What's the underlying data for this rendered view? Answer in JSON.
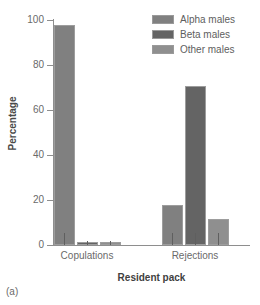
{
  "caption": "(a)",
  "legend": {
    "position": "top-right",
    "entries": [
      {
        "label": "Alpha males",
        "color": "#808080"
      },
      {
        "label": "Beta males",
        "color": "#646464"
      },
      {
        "label": "Other males",
        "color": "#8f8f8f"
      }
    ]
  },
  "axes": {
    "ylabel": "Percentage",
    "xlabel": "Resident pack",
    "yticks": [
      {
        "value": 100,
        "label": "100"
      },
      {
        "value": 80,
        "label": "80"
      },
      {
        "value": 60,
        "label": "60"
      },
      {
        "value": 40,
        "label": "40"
      },
      {
        "value": 20,
        "label": "20"
      },
      {
        "value": 0,
        "label": "0"
      }
    ],
    "xticks": [
      "Copulations",
      "Rejections"
    ]
  },
  "chart_data": {
    "type": "bar",
    "title": "",
    "xlabel": "Resident pack",
    "ylabel": "Percentage",
    "ylim": [
      0,
      100
    ],
    "grid": false,
    "legend_position": "top-right",
    "categories": [
      "Copulations",
      "Rejections"
    ],
    "series": [
      {
        "name": "Alpha males",
        "color": "#808080",
        "values": [
          98,
          18
        ]
      },
      {
        "name": "Beta males",
        "color": "#646464",
        "values": [
          1.5,
          70.5
        ]
      },
      {
        "name": "Other males",
        "color": "#8f8f8f",
        "values": [
          1.5,
          11.5
        ]
      }
    ]
  }
}
